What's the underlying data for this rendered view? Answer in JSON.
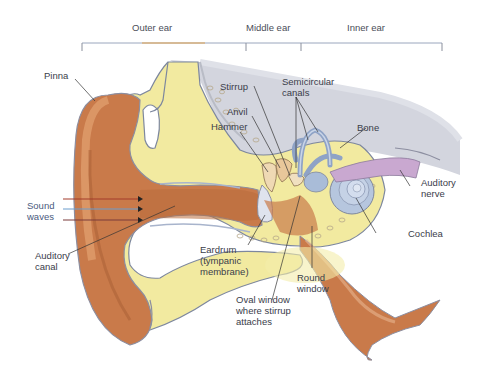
{
  "diagram": {
    "sections": [
      {
        "label": "Outer ear",
        "x": 132
      },
      {
        "label": "Middle ear",
        "x": 246
      },
      {
        "label": "Inner ear",
        "x": 347
      }
    ],
    "labels": {
      "pinna": "Pinna",
      "sound_waves": "Sound\nwaves",
      "auditory_canal": "Auditory\ncanal",
      "stirrup": "Stirrup",
      "anvil": "Anvil",
      "hammer": "Hammer",
      "semicircular_canals": "Semicircular\ncanals",
      "bone": "Bone",
      "auditory_nerve": "Auditory\nnerve",
      "cochlea": "Cochlea",
      "eardrum": "Eardrum\n(tympanic\nmembrane)",
      "round_window": "Round\nwindow",
      "oval_window": "Oval window\nwhere stirrup\nattaches"
    },
    "colors": {
      "skin": "#c97a4a",
      "skin_light": "#e8a878",
      "cartilage": "#f2eaa0",
      "bone_gray": "#c9cbd6",
      "inner_ear_blue": "#a9bcd8",
      "nerve_purple": "#c9a8d0",
      "label_text": "#3a3d4a",
      "bracket_line": "#9aa6bd"
    }
  }
}
